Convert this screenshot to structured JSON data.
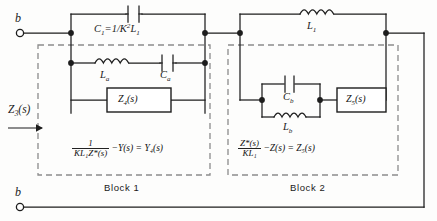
{
  "figure": {
    "type": "circuit-schematic",
    "terminals": [
      {
        "name": "top-terminal",
        "label": "b"
      },
      {
        "name": "bottom-terminal",
        "label": "b"
      }
    ],
    "input_impedance": {
      "label": "Z",
      "sub": "3",
      "arg": "(s)",
      "full": "Z3(s)",
      "arrow": "right"
    },
    "components": {
      "c1": {
        "type": "capacitor",
        "label_main": "C",
        "label_sub": "1",
        "expression": "=1/K²L₁",
        "full": "C1 = 1/K²L1"
      },
      "la": {
        "type": "inductor",
        "label_main": "L",
        "label_sub": "a",
        "full": "La"
      },
      "ca": {
        "type": "capacitor",
        "label_main": "C",
        "label_sub": "a",
        "full": "Ca"
      },
      "z4": {
        "type": "impedance-box",
        "label": "Z",
        "sub": "4",
        "arg": "(s)",
        "full": "Z4(s)"
      },
      "l1": {
        "type": "inductor",
        "label_main": "L",
        "label_sub": "1",
        "full": "L1"
      },
      "cb": {
        "type": "capacitor",
        "label_main": "C",
        "label_sub": "b",
        "full": "Cb"
      },
      "lb": {
        "type": "inductor",
        "label_main": "L",
        "label_sub": "b",
        "full": "Lb"
      },
      "z5": {
        "type": "impedance-box",
        "label": "Z",
        "sub": "5",
        "arg": "(s)",
        "full": "Z5(s)"
      }
    },
    "blocks": [
      {
        "name": "block-1",
        "caption": "Block 1",
        "equation": {
          "frac_num": "1",
          "frac_den": "KL₁Z*(s)",
          "rest": "−Y(s) = Y₄(s)",
          "full": "1/(KL1Z*(s)) − Y(s) = Y4(s)"
        }
      },
      {
        "name": "block-2",
        "caption": "Block 2",
        "equation": {
          "frac_num": "Z*(s)",
          "frac_den": "KL₁",
          "rest": "−Z(s) = Z₅(s)",
          "full": "Z*(s)/(KL1) − Z(s) = Z5(s)"
        }
      }
    ],
    "colors": {
      "wire": "#1d1d1d",
      "dashed": "#8c8c8c",
      "background": "#fdfdfc",
      "text": "#111111"
    }
  }
}
